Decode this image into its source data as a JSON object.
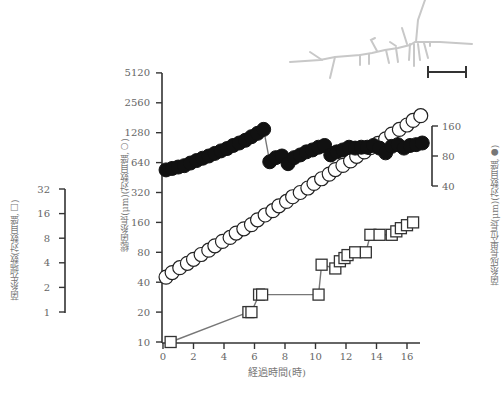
{
  "chart_data": {
    "type": "scatter",
    "title": "",
    "xlabel": "経過時間(時)",
    "x_ticks": [
      0,
      2,
      4,
      6,
      8,
      10,
      12,
      14,
      16
    ],
    "xlim": [
      0,
      17.5
    ],
    "axes": {
      "main_left": {
        "label": "総菌糸長(μm)(対数目盛,○)",
        "scale": "log2",
        "ticks": [
          10,
          20,
          40,
          80,
          160,
          320,
          640,
          1280,
          2560,
          5120
        ],
        "ylim": [
          10,
          5120
        ]
      },
      "far_left": {
        "label": "菌糸先端数(対数目盛,□)",
        "scale": "log2",
        "ticks": [
          1,
          2,
          4,
          8,
          16,
          32
        ],
        "ylim": [
          1,
          32
        ]
      },
      "right": {
        "label": "菌糸成長単位長(μm)(対数目盛,●)",
        "scale": "log2",
        "ticks": [
          40,
          80,
          160
        ],
        "ylim": [
          40,
          160
        ]
      }
    },
    "series": [
      {
        "name": "総菌糸長 (○)",
        "marker": "open-circle",
        "axis": "main_left",
        "x": [
          0.2,
          0.6,
          1.1,
          1.6,
          2.0,
          2.5,
          3.0,
          3.4,
          3.9,
          4.4,
          4.8,
          5.3,
          5.8,
          6.2,
          6.7,
          7.2,
          7.6,
          8.1,
          8.5,
          9.0,
          9.5,
          9.9,
          10.4,
          10.9,
          11.3,
          11.8,
          12.3,
          12.7,
          13.2,
          13.6,
          14.1,
          14.6,
          15.0,
          15.5,
          16.0,
          16.4,
          16.9
        ],
        "values": [
          45,
          50,
          56,
          62,
          68,
          76,
          84,
          93,
          103,
          113,
          125,
          138,
          152,
          170,
          190,
          210,
          235,
          260,
          290,
          320,
          355,
          395,
          440,
          490,
          545,
          600,
          665,
          740,
          820,
          905,
          1000,
          1110,
          1240,
          1380,
          1530,
          1700,
          1900
        ]
      },
      {
        "name": "菌糸成長単位長 (●)",
        "marker": "filled-circle",
        "axis": "right",
        "x": [
          0.2,
          0.6,
          1.0,
          1.4,
          1.8,
          2.2,
          2.6,
          3.0,
          3.4,
          3.8,
          4.2,
          4.6,
          5.0,
          5.4,
          5.8,
          6.2,
          6.6,
          7.0,
          7.4,
          7.8,
          8.2,
          8.6,
          9.0,
          9.4,
          9.8,
          10.2,
          10.6,
          11.0,
          11.4,
          11.8,
          12.2,
          12.6,
          13.0,
          13.4,
          13.8,
          14.2,
          14.6,
          15.0,
          15.4,
          15.8,
          16.2,
          16.6,
          17.0
        ],
        "values": [
          58,
          60,
          62,
          64,
          68,
          72,
          76,
          80,
          85,
          90,
          95,
          102,
          108,
          115,
          125,
          135,
          148,
          70,
          77,
          80,
          67,
          77,
          82,
          88,
          92,
          98,
          102,
          82,
          88,
          92,
          98,
          96,
          98,
          98,
          102,
          96,
          86,
          100,
          104,
          96,
          102,
          104,
          108
        ]
      },
      {
        "name": "菌糸先端数 (□)",
        "marker": "open-square",
        "axis": "far_left",
        "x": [
          0.5,
          5.6,
          5.8,
          6.3,
          6.5,
          10.2,
          10.4,
          11.3,
          11.6,
          11.9,
          12.1,
          12.6,
          13.3,
          13.6,
          14.2,
          15.0,
          15.3,
          15.6,
          16.0,
          16.4
        ],
        "values": [
          1,
          2,
          2,
          3,
          3,
          3,
          6,
          5.5,
          6.5,
          7,
          7.5,
          8,
          8,
          12,
          12,
          12,
          13,
          14,
          15,
          16
        ]
      }
    ],
    "annotations": {
      "scale_bar": "│—│",
      "inset": "hyphal colony line drawing (gray)"
    },
    "grid": false,
    "legend": "none (markers indicated in axis labels)"
  },
  "labels": {
    "x_title": "経過時間(時)",
    "main_y_title": "総菌糸長(μm)(対数目盛,○)",
    "left_y_title": "菌糸先端数(対数目盛,□)",
    "right_y_title": "菌糸成長単位長(μm)(対数目盛,●)",
    "x_ticks": [
      "0",
      "2",
      "4",
      "6",
      "8",
      "10",
      "12",
      "14",
      "16"
    ],
    "main_y_ticks": [
      "5120",
      "2560",
      "1280",
      "640",
      "320",
      "160",
      "80",
      "40",
      "20",
      "10"
    ],
    "left_y_ticks": [
      "32",
      "16",
      "8",
      "4",
      "2",
      "1"
    ],
    "right_y_ticks": [
      "160",
      "80",
      "40"
    ]
  }
}
